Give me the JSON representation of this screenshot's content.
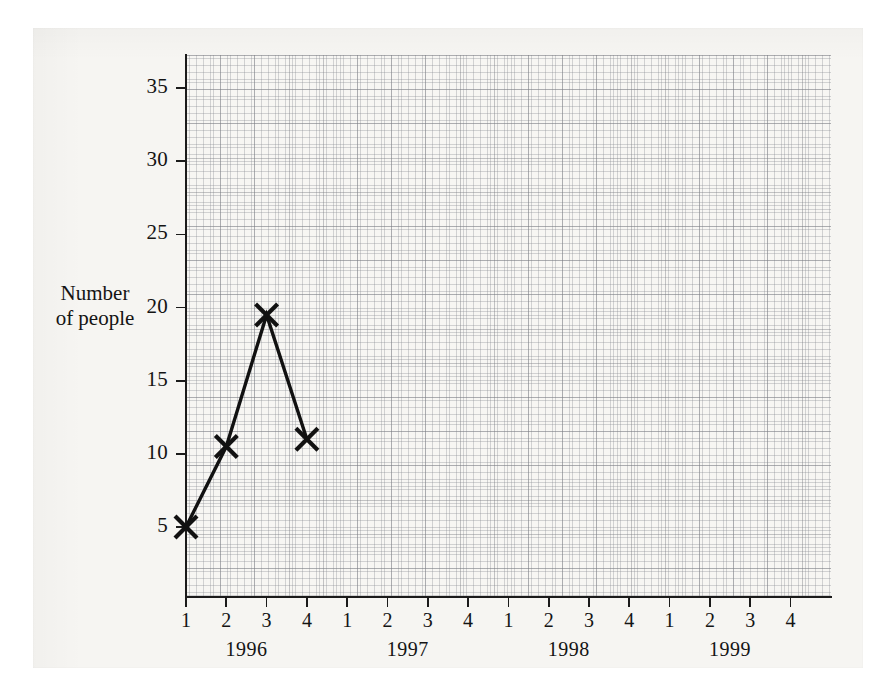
{
  "axis_title": {
    "line1": "Number",
    "line2": "of people"
  },
  "chart_data": {
    "type": "line",
    "title": "",
    "xlabel": "",
    "ylabel": "Number of people",
    "grid": true,
    "legend": "none",
    "marker": "x-cross",
    "ylim": [
      0,
      37
    ],
    "yticks": [
      5,
      10,
      15,
      20,
      25,
      30,
      35
    ],
    "ytick_labels": [
      "5",
      "10",
      "15",
      "20",
      "25",
      "30",
      "35"
    ],
    "xlim": [
      0.5,
      16.5
    ],
    "quarters": [
      "1",
      "2",
      "3",
      "4",
      "1",
      "2",
      "3",
      "4",
      "1",
      "2",
      "3",
      "4",
      "1",
      "2",
      "3",
      "4"
    ],
    "years": [
      "1996",
      "1997",
      "1998",
      "1999"
    ],
    "x": [
      "1996 Q1",
      "1996 Q2",
      "1996 Q3",
      "1996 Q4"
    ],
    "values": [
      5,
      10.5,
      19.5,
      11
    ],
    "series": [
      {
        "name": "Number of people",
        "values": [
          5,
          10.5,
          19.5,
          11
        ]
      }
    ],
    "line_color": "#111111",
    "paper_color": "#f6f5f2",
    "grid_color": "#8a8d94"
  }
}
